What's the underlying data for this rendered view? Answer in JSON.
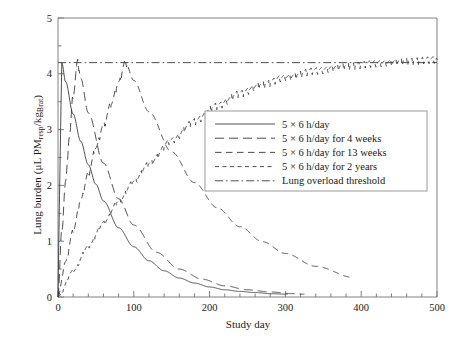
{
  "chart_data": {
    "type": "line",
    "title": "",
    "xlabel": "Study day",
    "ylabel_parts": {
      "prefix": "Lung burden (μL PM",
      "sub1": "resp",
      "mid": "/kg",
      "sub2": "Brat",
      "suffix": ")"
    },
    "ylabel": "Lung burden (μL PMresp/kgBrat)",
    "xlim": [
      0,
      500
    ],
    "ylim": [
      0,
      5
    ],
    "xticks": [
      0,
      100,
      200,
      300,
      400,
      500
    ],
    "yticks": [
      0,
      1,
      2,
      3,
      4,
      5
    ],
    "xminor_step": 20,
    "yminor_step": 0.5,
    "grid": false,
    "legend_position": "center-right",
    "threshold_value": 4.2,
    "series": [
      {
        "name": "5 × 6 h/day",
        "style": "solid",
        "exposure_days": 5,
        "peak_value": 4.2,
        "peak_day": 5,
        "end_day": 303,
        "end_value": 0.15,
        "x": [
          0,
          1,
          2,
          3,
          4,
          5,
          10,
          20,
          30,
          40,
          50,
          60,
          80,
          100,
          120,
          140,
          160,
          180,
          200,
          220,
          240,
          260,
          280,
          303
        ],
        "y": [
          0,
          0.95,
          1.82,
          2.62,
          3.45,
          4.2,
          3.86,
          3.28,
          2.79,
          2.37,
          2.02,
          1.72,
          1.24,
          0.9,
          0.65,
          0.47,
          0.34,
          0.25,
          0.18,
          0.13,
          0.1,
          0.08,
          0.06,
          0.05
        ]
      },
      {
        "name": "5 × 6 h/day for 4 weeks",
        "style": "long-dash",
        "exposure_days": 28,
        "peak_value": 4.2,
        "peak_day": 26,
        "end_day": 325,
        "end_value": 0.14,
        "x": [
          0,
          5,
          10,
          15,
          20,
          26,
          30,
          40,
          60,
          80,
          100,
          130,
          160,
          190,
          220,
          250,
          280,
          310,
          325
        ],
        "y": [
          0,
          1.18,
          2.05,
          2.85,
          3.6,
          4.2,
          3.92,
          3.3,
          2.4,
          1.76,
          1.29,
          0.8,
          0.5,
          0.32,
          0.2,
          0.13,
          0.09,
          0.06,
          0.05
        ]
      },
      {
        "name": "5 × 6 h/day for 13 weeks",
        "style": "medium-dash",
        "exposure_days": 91,
        "peak_value": 4.2,
        "peak_day": 89,
        "end_day": 390,
        "end_value": 0.15,
        "x": [
          0,
          10,
          20,
          30,
          40,
          50,
          60,
          70,
          80,
          89,
          100,
          120,
          150,
          180,
          210,
          240,
          270,
          300,
          340,
          390
        ],
        "y": [
          0,
          0.62,
          1.18,
          1.72,
          2.2,
          2.66,
          3.06,
          3.44,
          3.82,
          4.2,
          3.88,
          3.32,
          2.6,
          2.05,
          1.6,
          1.26,
          0.99,
          0.78,
          0.55,
          0.35
        ]
      },
      {
        "name": "5 × 6 h/day for 2 years",
        "style": "short-dash",
        "exposure_days": 500,
        "peak_value": 4.25,
        "peak_day": 500,
        "end_day": 500,
        "end_value": 4.25,
        "x": [
          0,
          20,
          40,
          60,
          80,
          100,
          120,
          150,
          180,
          210,
          240,
          270,
          300,
          340,
          380,
          420,
          460,
          500
        ],
        "y": [
          0,
          0.46,
          0.9,
          1.32,
          1.7,
          2.06,
          2.38,
          2.8,
          3.14,
          3.42,
          3.64,
          3.8,
          3.93,
          4.05,
          4.13,
          4.18,
          4.22,
          4.25
        ]
      },
      {
        "name": "Lung overload threshold",
        "style": "dash-dot",
        "constant_value": 4.2,
        "x": [
          0,
          500
        ],
        "y": [
          4.2,
          4.2
        ]
      }
    ]
  },
  "axes": {
    "x_tick_labels": [
      "0",
      "100",
      "200",
      "300",
      "400",
      "500"
    ],
    "y_tick_labels": [
      "0",
      "1",
      "2",
      "3",
      "4",
      "5"
    ]
  },
  "legend": {
    "items": [
      {
        "label": "5 × 6 h/day",
        "style": "solid"
      },
      {
        "label": "5 × 6 h/day for 4 weeks",
        "style": "long-dash"
      },
      {
        "label": "5 × 6 h/day for 13 weeks",
        "style": "medium-dash"
      },
      {
        "label": "5 × 6 h/day for 2 years",
        "style": "short-dash"
      },
      {
        "label": "Lung overload threshold",
        "style": "dash-dot"
      }
    ]
  },
  "colors": {
    "line": "#3a3a3a",
    "axis": "#808080",
    "text": "#1a1a1a",
    "background": "#ffffff",
    "legend_border": "#9a9a9a"
  }
}
